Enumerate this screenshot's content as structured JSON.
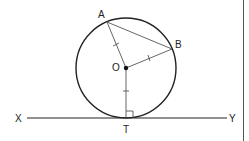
{
  "diagram": {
    "type": "circle-tangent-geometry",
    "points": {
      "A": {
        "label": "A",
        "x": 107,
        "y": 22
      },
      "B": {
        "label": "B",
        "x": 172,
        "y": 49
      },
      "O": {
        "label": "O",
        "x": 126,
        "y": 68
      },
      "T": {
        "label": "T",
        "x": 126,
        "y": 118
      },
      "X": {
        "label": "X",
        "x": 27,
        "y": 118
      },
      "Y": {
        "label": "Y",
        "x": 227,
        "y": 118
      }
    },
    "circle": {
      "center": "O",
      "radius": 50
    },
    "segments": [
      "OA",
      "OB",
      "AB",
      "OT",
      "XY"
    ],
    "equal_marks": [
      "OA",
      "OB",
      "OT"
    ],
    "right_angle_at": "T",
    "labels": {
      "A": "A",
      "B": "B",
      "O": "O",
      "T": "T",
      "X": "X",
      "Y": "Y"
    },
    "colors": {
      "stroke": "#222222",
      "thin_stroke": "#555555",
      "background": "#ffffff"
    }
  }
}
